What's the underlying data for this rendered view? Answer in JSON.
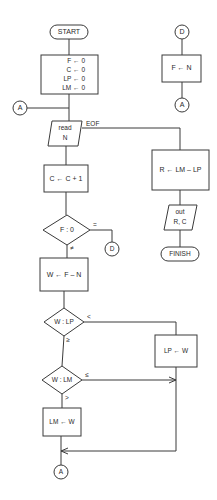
{
  "flowchart": {
    "start": {
      "label": "START"
    },
    "init": {
      "lines": [
        "F ← 0",
        "C ← 0",
        "LP ← 0",
        "LM ← 0"
      ]
    },
    "connector_a_top": {
      "label": "A"
    },
    "read": {
      "line1": "read",
      "line2": "N",
      "eof_label": "EOF"
    },
    "increment": {
      "label": "C ← C + 1"
    },
    "decision_f": {
      "label": "F : 0",
      "eq_label": "=",
      "neq_label": "≠"
    },
    "connector_d_left": {
      "label": "D"
    },
    "compute_w": {
      "label": "W ← F – N"
    },
    "decision_lp": {
      "label": "W : LP",
      "lt_label": "<",
      "ge_label": "≥"
    },
    "assign_lp": {
      "label": "LP ← W"
    },
    "decision_lm": {
      "label": "W : LM",
      "le_label": "≤",
      "gt_label": ">"
    },
    "assign_lm": {
      "label": "LM ← W"
    },
    "connector_a_bottom": {
      "label": "A"
    },
    "connector_d_right": {
      "label": "D"
    },
    "assign_f": {
      "label": "F ← N"
    },
    "connector_a_right": {
      "label": "A"
    },
    "compute_r": {
      "label": "R ← LM – LP"
    },
    "output": {
      "line1": "out",
      "line2": "R, C"
    },
    "finish": {
      "label": "FINISH"
    }
  },
  "colors": {
    "line": "#3a3a3a",
    "background": "#ffffff"
  }
}
